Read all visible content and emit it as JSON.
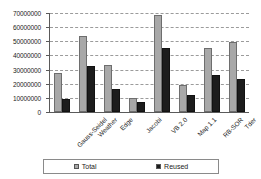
{
  "chart_data": {
    "type": "bar",
    "title": "",
    "subtitle": "",
    "xlabel": "",
    "ylabel": "",
    "ylim": [
      0,
      70000000
    ],
    "grid": true,
    "legend_position": "bottom",
    "categories": [
      "Gauss-Seidel",
      "Weather",
      "Edge",
      "Jacobi",
      "VB 2.0",
      "Map 1.1",
      "RB-SOR",
      "Tder"
    ],
    "y_ticks": [
      "0",
      "10000000",
      "20000000",
      "30000000",
      "40000000",
      "50000000",
      "60000000",
      "70000000"
    ],
    "y_tick_values": [
      0,
      10000000,
      20000000,
      30000000,
      40000000,
      50000000,
      60000000,
      70000000
    ],
    "series": [
      {
        "name": "Total",
        "color": "#a8a8a8",
        "values": [
          27500000,
          54000000,
          33500000,
          10000000,
          68500000,
          19000000,
          45000000,
          49500000
        ]
      },
      {
        "name": "Reused",
        "color": "#1c1c1c",
        "values": [
          9000000,
          32500000,
          16000000,
          7000000,
          45500000,
          12000000,
          26500000,
          23000000
        ]
      }
    ]
  },
  "legend": {
    "items": [
      {
        "label": "Total",
        "swatch": "total"
      },
      {
        "label": "Reused",
        "swatch": "reused"
      }
    ]
  }
}
